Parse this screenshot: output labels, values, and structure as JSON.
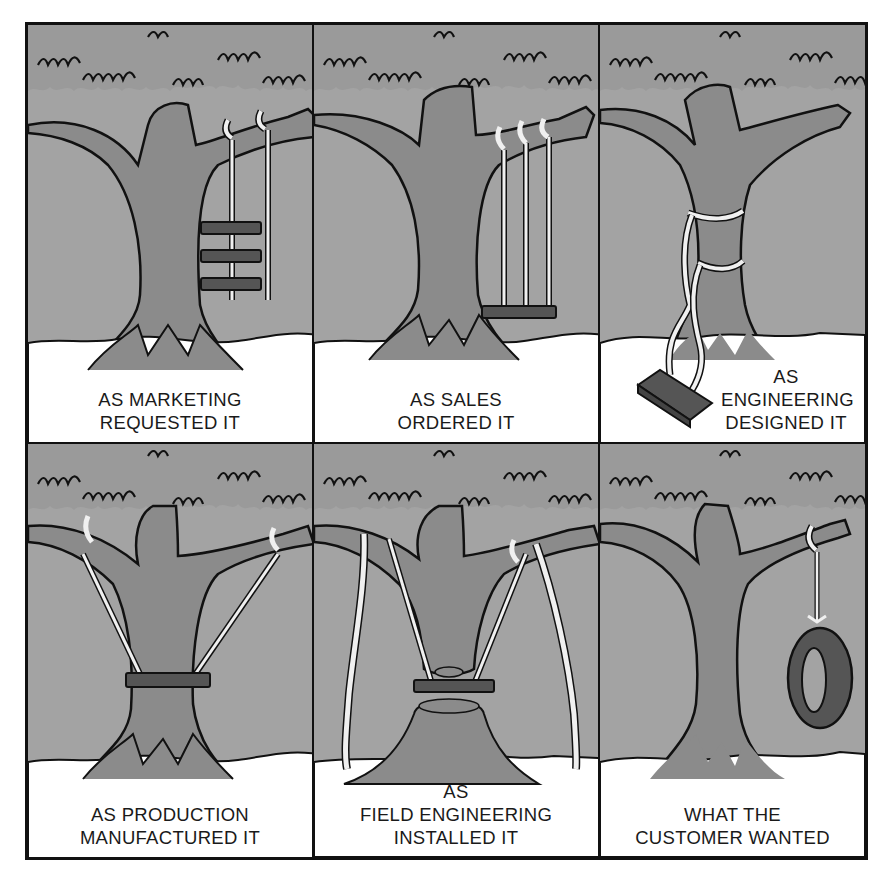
{
  "comic": {
    "colors": {
      "sky": "#a3a3a3",
      "trunk": "#8b8b8b",
      "outline": "#111111",
      "snow": "#ffffff",
      "rope": "#f0f0f0",
      "seat": "#555555",
      "text": "#1a1a1a"
    },
    "panels": [
      {
        "id": "marketing",
        "swing": "three-tier-seats",
        "caption": [
          "AS MARKETING",
          "REQUESTED IT"
        ]
      },
      {
        "id": "sales",
        "swing": "three-ropes-single-seat",
        "caption": [
          "AS SALES",
          "ORDERED IT"
        ]
      },
      {
        "id": "engineering",
        "swing": "ropes-tied-around-trunk",
        "caption": [
          "AS",
          "ENGINEERING",
          "DESIGNED IT"
        ]
      },
      {
        "id": "production",
        "swing": "seat-around-trunk",
        "caption": [
          "AS PRODUCTION",
          "MANUFACTURED IT"
        ]
      },
      {
        "id": "field-engineering",
        "swing": "trunk-cut-props",
        "caption": [
          "AS",
          "FIELD ENGINEERING",
          "INSTALLED IT"
        ]
      },
      {
        "id": "customer",
        "swing": "tire-swing",
        "caption": [
          "WHAT THE",
          "CUSTOMER WANTED"
        ]
      }
    ]
  }
}
